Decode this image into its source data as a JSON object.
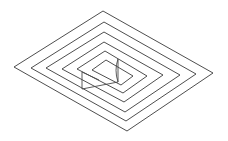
{
  "figure": {
    "title": "Isometric nested diamond line drawing",
    "background_color": "#ffffff",
    "line_color": "#3a3a3a",
    "detail_line_color": "#4a4a4a",
    "stroke_width": "0.9",
    "canvas": {
      "width": 228,
      "height": 141
    },
    "ring_count": 5,
    "inner_shape_count": 1,
    "detail_segment_count": 3
  },
  "chart_data": {
    "type": "line",
    "title": "Isometric nested diamond line drawing",
    "xlabel": "",
    "ylabel": "",
    "xlim": [
      0,
      228
    ],
    "ylim": [
      0,
      141
    ],
    "grid": false,
    "legend": "none",
    "series": [
      {
        "name": "ring-1-outer",
        "closed": true,
        "points": [
          [
            103,
            11
          ],
          [
            213,
            73
          ],
          [
            127,
            131
          ],
          [
            14,
            67
          ]
        ]
      },
      {
        "name": "ring-2",
        "closed": true,
        "points": [
          [
            104,
            22
          ],
          [
            196,
            74
          ],
          [
            126,
            121
          ],
          [
            31,
            68
          ]
        ]
      },
      {
        "name": "ring-3",
        "closed": true,
        "points": [
          [
            104,
            32
          ],
          [
            180,
            75
          ],
          [
            125,
            112
          ],
          [
            46,
            68
          ]
        ]
      },
      {
        "name": "ring-4",
        "closed": true,
        "points": [
          [
            104,
            42
          ],
          [
            163,
            75
          ],
          [
            124,
            102
          ],
          [
            62,
            69
          ]
        ]
      },
      {
        "name": "ring-5-inner",
        "closed": true,
        "points": [
          [
            105,
            51
          ],
          [
            147,
            76
          ],
          [
            123,
            93
          ],
          [
            77,
            69
          ]
        ]
      },
      {
        "name": "core-parallelogram",
        "closed": true,
        "points": [
          [
            106,
            60
          ],
          [
            133,
            76
          ],
          [
            121,
            85
          ],
          [
            92,
            70
          ]
        ]
      },
      {
        "name": "vertical-post-right",
        "closed": false,
        "points": [
          [
            118,
            59
          ],
          [
            118,
            82
          ]
        ]
      },
      {
        "name": "vertical-post-left",
        "closed": false,
        "points": [
          [
            82,
            72
          ],
          [
            82,
            89
          ]
        ]
      },
      {
        "name": "wedge-diagonal",
        "closed": false,
        "points": [
          [
            118,
            82
          ],
          [
            82,
            89
          ]
        ]
      },
      {
        "name": "wedge-curve",
        "closed": false,
        "points": [
          [
            118,
            59
          ],
          [
            114,
            70
          ],
          [
            118,
            82
          ]
        ]
      },
      {
        "name": "wedge-base-left",
        "closed": false,
        "points": [
          [
            82,
            72
          ],
          [
            99,
            80
          ]
        ]
      }
    ]
  }
}
